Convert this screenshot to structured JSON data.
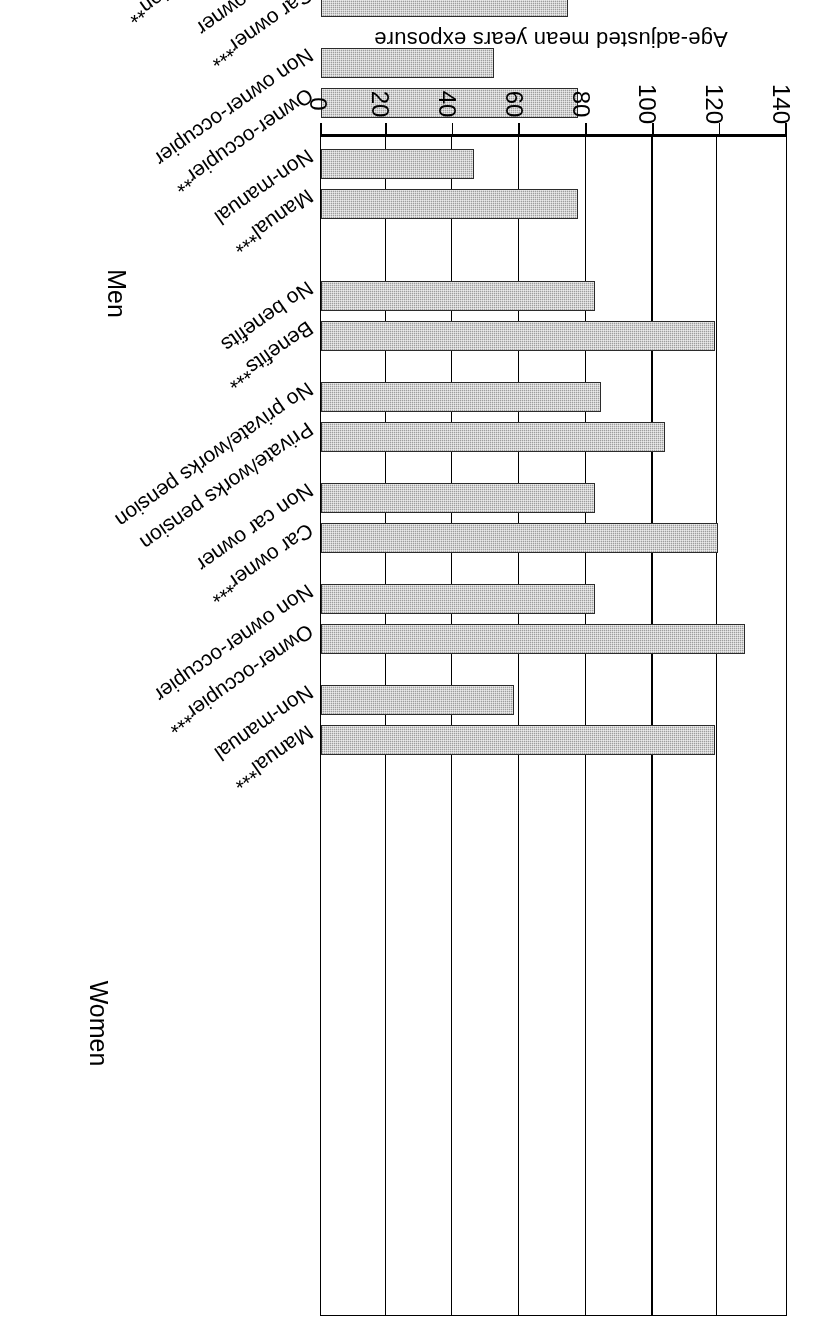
{
  "chart_data": {
    "type": "bar",
    "orientation": "horizontal",
    "title": "",
    "xlabel": "Age-adjusted mean years exposure",
    "ylabel": "",
    "xlim": [
      0,
      140
    ],
    "ticks": [
      140,
      120,
      100,
      80,
      60,
      40,
      20,
      0
    ],
    "grid": true,
    "legend": "none",
    "note": "Figure is printed rotated 180 degrees in the source scan.",
    "groups": [
      {
        "name": "Men",
        "categories": [
          "Manual***",
          "Non-manual",
          "Owner-occupier***",
          "Non owner-occupier",
          "Car owner***",
          "Non car owner",
          "Private/works pension",
          "No private/works pension",
          "Benefits***",
          "No benefits"
        ],
        "values": [
          118,
          58,
          127,
          82,
          119,
          82,
          103,
          84,
          118,
          82
        ]
      },
      {
        "name": "Women",
        "categories": [
          "Manual***",
          "Non-manual",
          "Owner-occupier**",
          "Non owner-occupier",
          "Car owner***",
          "Non car owner",
          "Private/works pension**",
          "No private/works pension",
          "Benefits***",
          "No benefits"
        ],
        "values": [
          77,
          46,
          77,
          52,
          74,
          54,
          74,
          50,
          80,
          52
        ]
      }
    ]
  },
  "axis": {
    "title": "Age-adjusted mean years exposure",
    "tick_labels": [
      "140",
      "120",
      "100",
      "80",
      "60",
      "40",
      "20",
      "0"
    ]
  },
  "group_labels": {
    "men": "Men",
    "women": "Women"
  },
  "categories": {
    "men": [
      "Manual***",
      "Non-manual",
      "Owner-occupier***",
      "Non owner-occupier",
      "Car owner***",
      "Non car owner",
      "Private/works pension",
      "No private/works pension",
      "Benefits***",
      "No benefits"
    ],
    "women": [
      "Manual***",
      "Non-manual",
      "Owner-occupier**",
      "Non owner-occupier",
      "Car owner***",
      "Non car owner",
      "Private/works pension**",
      "No private/works pension",
      "Benefits***",
      "No benefits"
    ]
  },
  "colors": {
    "bar_fill": "#9e9e9e",
    "bar_stroke": "#2b2b2b",
    "axis": "#000000",
    "background": "#ffffff"
  }
}
